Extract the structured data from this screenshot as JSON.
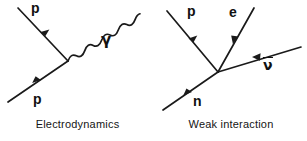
{
  "figure": {
    "background_color": "#ffffff",
    "line_color": "#1a1a1a",
    "panels": [
      {
        "id": "electrodynamics",
        "caption": "Electrodynamics",
        "vertex": {
          "x": 68,
          "y": 61
        },
        "particles": [
          {
            "name": "incoming-proton",
            "label": "p",
            "line": "straight",
            "from": {
              "x": 8,
              "y": 102
            },
            "to": {
              "x": 68,
              "y": 61
            },
            "arrow_at": 0.55,
            "arrow_direction": "toward-vertex",
            "label_pos": {
              "x": 33,
              "y": 94
            }
          },
          {
            "name": "outgoing-proton",
            "label": "p",
            "line": "straight",
            "from": {
              "x": 68,
              "y": 61
            },
            "to": {
              "x": 18,
              "y": 8
            },
            "arrow_at": 0.55,
            "arrow_direction": "away-from-vertex",
            "label_pos": {
              "x": 31,
              "y": 2
            }
          },
          {
            "name": "photon",
            "label": "γ",
            "line": "wavy",
            "from": {
              "x": 68,
              "y": 61
            },
            "to": {
              "x": 120,
              "y": 10
            },
            "arrow_at": null,
            "arrow_direction": "none",
            "label_pos": {
              "x": 101,
              "y": 34
            }
          }
        ]
      },
      {
        "id": "weak-interaction",
        "caption": "Weak interaction",
        "vertex": {
          "x": 63,
          "y": 72
        },
        "particles": [
          {
            "name": "incoming-neutron",
            "label": "n",
            "line": "straight",
            "from": {
              "x": 8,
              "y": 110
            },
            "to": {
              "x": 63,
              "y": 72
            },
            "arrow_at": 0.52,
            "arrow_direction": "toward-vertex",
            "label_pos": {
              "x": 38,
              "y": 96
            }
          },
          {
            "name": "outgoing-proton",
            "label": "p",
            "line": "straight",
            "from": {
              "x": 63,
              "y": 72
            },
            "to": {
              "x": 12,
              "y": 11
            },
            "arrow_at": 0.55,
            "arrow_direction": "away-from-vertex",
            "label_pos": {
              "x": 32,
              "y": 5
            }
          },
          {
            "name": "outgoing-electron",
            "label": "e",
            "line": "straight",
            "from": {
              "x": 63,
              "y": 72
            },
            "to": {
              "x": 99,
              "y": 8
            },
            "arrow_at": 0.55,
            "arrow_direction": "away-from-vertex",
            "label_pos": {
              "x": 74,
              "y": 6
            }
          },
          {
            "name": "antineutrino",
            "label": "ν",
            "label_overline": true,
            "line": "straight",
            "from": {
              "x": 63,
              "y": 72
            },
            "to": {
              "x": 146,
              "y": 47
            },
            "arrow_at": 0.62,
            "arrow_direction": "toward-vertex",
            "label_pos": {
              "x": 109,
              "y": 58
            }
          }
        ]
      }
    ]
  }
}
